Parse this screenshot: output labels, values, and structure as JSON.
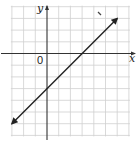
{
  "chart_data": {
    "type": "line",
    "title": "",
    "xlabel": "x",
    "ylabel": "y",
    "origin_label": "0",
    "xlim": [
      -3,
      7
    ],
    "ylim": [
      -7,
      4
    ],
    "grid": true,
    "grid_step": 1,
    "series": [
      {
        "name": "line",
        "equation": "y = x - 3",
        "x": [
          -3,
          6
        ],
        "y": [
          -6,
          3
        ],
        "arrows": "both"
      }
    ],
    "colors": {
      "line": "#222222",
      "axis": "#333333",
      "grid": "#cfcfcf"
    }
  }
}
